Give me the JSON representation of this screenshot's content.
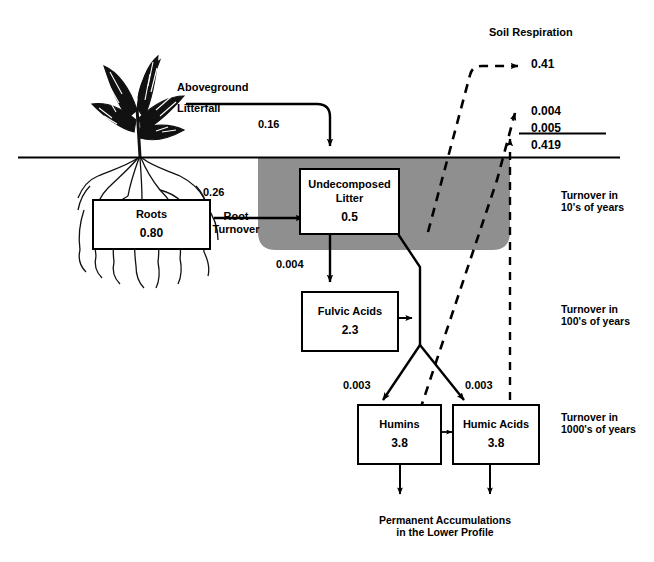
{
  "diagram": {
    "title_top": "Soil Respiration",
    "shaded_color": "#8f8f8f",
    "line_color": "#000000"
  },
  "pools": [
    {
      "key": "roots",
      "name": "Roots",
      "value": "0.80"
    },
    {
      "key": "litter",
      "name": "Undecomposed\nLitter",
      "name_line1": "Undecomposed",
      "name_line2": "Litter",
      "value": "0.5"
    },
    {
      "key": "fulvic",
      "name": "Fulvic Acids",
      "value": "2.3"
    },
    {
      "key": "humins",
      "name": "Humins",
      "value": "3.8"
    },
    {
      "key": "humic",
      "name": "Humic Acids",
      "value": "3.8"
    }
  ],
  "flux_labels": {
    "aboveground": "Aboveground",
    "litterfall": "Litterfall",
    "litterfall_value": "0.16",
    "root_value": "0.26",
    "root_turnover_l1": "Root",
    "root_turnover_l2": "Turnover",
    "litter_to_fulvic": "0.004",
    "to_humins": "0.003",
    "to_humic": "0.003"
  },
  "respiration": {
    "label": "Soil Respiration",
    "items": [
      {
        "value": "0.41"
      },
      {
        "value": "0.004"
      },
      {
        "value": "0.005"
      }
    ],
    "total": "0.419"
  },
  "turnover": [
    {
      "line1": "Turnover in",
      "line2": "10's of years"
    },
    {
      "line1": "Turnover in",
      "line2": "100's of years"
    },
    {
      "line1": "Turnover in",
      "line2": "1000's of years"
    }
  ],
  "footer": {
    "line1": "Permanent Accumulations",
    "line2": "in the Lower Profile"
  }
}
